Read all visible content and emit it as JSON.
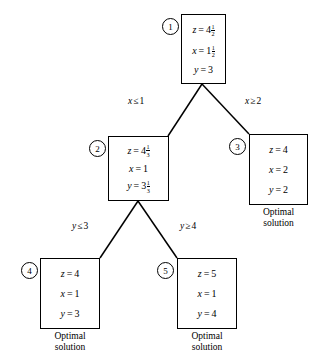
{
  "diagram": {
    "line_color": "#000000",
    "background_color": "#ffffff"
  },
  "nodes": [
    {
      "id": "1",
      "index_label": "1",
      "lines": [
        {
          "var": "z",
          "eq": "=",
          "whole": "4",
          "num": "1",
          "den": "2"
        },
        {
          "var": "x",
          "eq": "=",
          "whole": "1",
          "num": "1",
          "den": "2"
        },
        {
          "var": "y",
          "eq": "=",
          "whole": "3",
          "num": "",
          "den": ""
        }
      ],
      "caption": ""
    },
    {
      "id": "2",
      "index_label": "2",
      "lines": [
        {
          "var": "z",
          "eq": "=",
          "whole": "4",
          "num": "1",
          "den": "3"
        },
        {
          "var": "x",
          "eq": "=",
          "whole": "1",
          "num": "",
          "den": ""
        },
        {
          "var": "y",
          "eq": "=",
          "whole": "3",
          "num": "1",
          "den": "3"
        }
      ],
      "caption": ""
    },
    {
      "id": "3",
      "index_label": "3",
      "lines": [
        {
          "var": "z",
          "eq": "=",
          "whole": "4",
          "num": "",
          "den": ""
        },
        {
          "var": "x",
          "eq": "=",
          "whole": "2",
          "num": "",
          "den": ""
        },
        {
          "var": "y",
          "eq": "=",
          "whole": "2",
          "num": "",
          "den": ""
        }
      ],
      "caption_line1": "Optimal",
      "caption_line2": "solution"
    },
    {
      "id": "4",
      "index_label": "4",
      "lines": [
        {
          "var": "z",
          "eq": "=",
          "whole": "4",
          "num": "",
          "den": ""
        },
        {
          "var": "x",
          "eq": "=",
          "whole": "1",
          "num": "",
          "den": ""
        },
        {
          "var": "y",
          "eq": "=",
          "whole": "3",
          "num": "",
          "den": ""
        }
      ],
      "caption_line1": "Optimal",
      "caption_line2": "solution"
    },
    {
      "id": "5",
      "index_label": "5",
      "lines": [
        {
          "var": "z",
          "eq": "=",
          "whole": "5",
          "num": "",
          "den": ""
        },
        {
          "var": "x",
          "eq": "=",
          "whole": "1",
          "num": "",
          "den": ""
        },
        {
          "var": "y",
          "eq": "=",
          "whole": "4",
          "num": "",
          "den": ""
        }
      ],
      "caption_line1": "Optimal",
      "caption_line2": "solution"
    }
  ],
  "branches": [
    {
      "id": "1-2",
      "var": "x",
      "rel": "≤",
      "value": "1"
    },
    {
      "id": "1-3",
      "var": "x",
      "rel": "≥",
      "value": "2"
    },
    {
      "id": "2-4",
      "var": "y",
      "rel": "≤",
      "value": "3"
    },
    {
      "id": "2-5",
      "var": "y",
      "rel": "≥",
      "value": "4"
    }
  ]
}
